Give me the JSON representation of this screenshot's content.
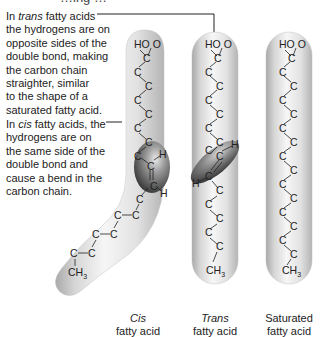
{
  "header": {
    "partial_title": "…ing …"
  },
  "annotations": {
    "trans": {
      "prefix": "In ",
      "emphasis": "trans",
      "rest": " fatty acids",
      "lines": [
        "the hydrogens are on",
        "opposite sides of the",
        "double bond, making",
        "the carbon chain",
        "straighter, similar",
        "to the shape of a",
        "saturated fatty acid."
      ]
    },
    "cis": {
      "prefix": "In ",
      "emphasis": "cis",
      "rest": " fatty acids, the",
      "lines": [
        "hydrogens are on",
        "the same side of the",
        "double bond and",
        "cause a bend in the",
        "carbon chain."
      ]
    }
  },
  "molecules": {
    "cis": {
      "caption_emphasis": "Cis",
      "caption_rest": "fatty acid",
      "carboxyl": "HO  O",
      "terminal": "CH",
      "terminal_sub": "3",
      "atom": "C",
      "hydrogen": "H"
    },
    "trans": {
      "caption_emphasis": "Trans",
      "caption_rest": "fatty acid",
      "carboxyl": "HO  O",
      "terminal": "CH",
      "terminal_sub": "3",
      "atom": "C",
      "hydrogen": "H"
    },
    "saturated": {
      "caption_line1": "Saturated",
      "caption_rest": "fatty acid",
      "carboxyl": "HO  O",
      "terminal": "CH",
      "terminal_sub": "3",
      "atom": "C"
    }
  },
  "colors": {
    "capsule_light": "#f4f4f4",
    "capsule_dark": "#b8b8b8",
    "double_bond_dark": "#3a3a3a",
    "text": "#222222",
    "leader": "#222222"
  }
}
